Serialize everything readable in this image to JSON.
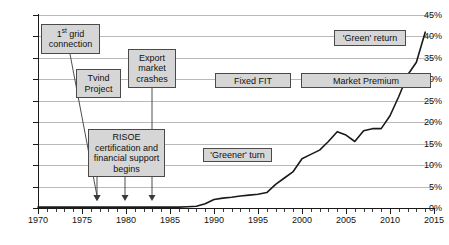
{
  "chart_data": {
    "type": "line",
    "title": "",
    "xlabel": "",
    "ylabel": "",
    "xlim": [
      1970,
      2015
    ],
    "ylim": [
      0,
      45
    ],
    "ytick_labels": [
      "0%",
      "5%",
      "10%",
      "15%",
      "20%",
      "25%",
      "30%",
      "35%",
      "40%",
      "45%"
    ],
    "ytick_values": [
      0,
      5,
      10,
      15,
      20,
      25,
      30,
      35,
      40,
      45
    ],
    "xtick_labels": [
      "1970",
      "1975",
      "1980",
      "1985",
      "1990",
      "1995",
      "2000",
      "2005",
      "2010",
      "2015"
    ],
    "xtick_values": [
      1970,
      1975,
      1980,
      1985,
      1990,
      1995,
      2000,
      2005,
      2010,
      2015
    ],
    "grid": true,
    "legend": "none",
    "series": [
      {
        "name": "Wind share of electricity",
        "x": [
          1970,
          1971,
          1972,
          1973,
          1974,
          1975,
          1976,
          1977,
          1978,
          1979,
          1980,
          1981,
          1982,
          1983,
          1984,
          1985,
          1986,
          1987,
          1988,
          1989,
          1990,
          1991,
          1992,
          1993,
          1994,
          1995,
          1996,
          1997,
          1998,
          1999,
          2000,
          2001,
          2002,
          2003,
          2004,
          2005,
          2006,
          2007,
          2008,
          2009,
          2010,
          2011,
          2012,
          2013,
          2014
        ],
        "values": [
          0.2,
          0.2,
          0.2,
          0.2,
          0.2,
          0.2,
          0.2,
          0.2,
          0.2,
          0.2,
          0.2,
          0.2,
          0.2,
          0.2,
          0.2,
          0.2,
          0.2,
          0.3,
          0.4,
          1.0,
          2.0,
          2.3,
          2.5,
          2.8,
          3.0,
          3.2,
          3.6,
          5.5,
          7.0,
          8.5,
          11.5,
          12.5,
          13.5,
          15.5,
          17.8,
          17.0,
          15.5,
          18.0,
          18.5,
          18.5,
          21.5,
          26.0,
          31.0,
          34.0,
          41.0
        ]
      }
    ],
    "annotations": [
      {
        "id": "first-grid-connection",
        "label": "1st grid connection",
        "label_pre": "1",
        "label_sup": "st",
        "label_post": " grid connection",
        "target_year": 1975
      },
      {
        "id": "tvind-project",
        "label": "Tvind Project",
        "target_year": 1980
      },
      {
        "id": "export-market-crashes",
        "label": "Export market crashes",
        "target_year": 1985
      },
      {
        "id": "risoe",
        "label": "RISOE certification and financial support begins",
        "target_year": 1980
      },
      {
        "id": "greener-turn",
        "label": "'Greener' turn"
      },
      {
        "id": "fixed-fit",
        "label": "Fixed FIT"
      },
      {
        "id": "market-premium",
        "label": "Market Premium"
      },
      {
        "id": "green-return",
        "label": "'Green' return"
      }
    ]
  },
  "labels": {
    "first_grid_connection_line1": "1",
    "first_grid_connection_sup": "st",
    "first_grid_connection_line1b": " grid",
    "first_grid_connection_line2": "connection",
    "tvind_line1": "Tvind",
    "tvind_line2": "Project",
    "export_line1": "Export",
    "export_line2": "market",
    "export_line3": "crashes",
    "risoe_line1": "RISOE",
    "risoe_line2": "certification and",
    "risoe_line3": "financial support",
    "risoe_line4": "begins",
    "greener_turn": "'Greener' turn",
    "fixed_fit": "Fixed FIT",
    "market_premium": "Market Premium",
    "green_return": "'Green' return"
  },
  "colors": {
    "series_line": "#1a1a1a",
    "gridline": "#b9b9b9",
    "axis": "#1a1a1a",
    "callout_fill": "#d6d6d6",
    "callout_border": "#4a4a4a"
  }
}
